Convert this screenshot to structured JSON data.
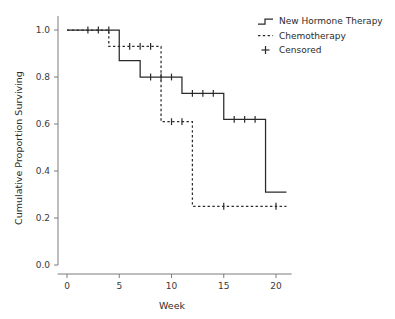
{
  "chart_data": {
    "type": "line",
    "title": "",
    "xlabel": "Week",
    "ylabel": "Cumulative Proportion Surviving",
    "xlim": [
      -0.9,
      21.5
    ],
    "ylim": [
      0.0,
      1.06
    ],
    "xticks": [
      0,
      5,
      10,
      15,
      20
    ],
    "xtick_labels": [
      "0",
      "5",
      "10",
      "15",
      "20"
    ],
    "yticks": [
      0.0,
      0.2,
      0.4,
      0.6,
      0.8,
      1.0
    ],
    "ytick_labels": [
      "0.0",
      "0.2",
      "0.4",
      "0.6",
      "0.8",
      "1.0"
    ],
    "grid": false,
    "legend_position": "top-right",
    "series": [
      {
        "name": "New Hormone Therapy",
        "style": "solid",
        "color": "#2a2a2a",
        "step_points": [
          [
            0,
            1.0
          ],
          [
            5,
            1.0
          ],
          [
            5,
            0.87
          ],
          [
            7,
            0.87
          ],
          [
            7,
            0.8
          ],
          [
            11,
            0.8
          ],
          [
            11,
            0.73
          ],
          [
            15,
            0.73
          ],
          [
            15,
            0.62
          ],
          [
            19,
            0.62
          ],
          [
            19,
            0.31
          ],
          [
            21,
            0.31
          ]
        ],
        "censored_weeks": [
          2,
          3,
          4,
          8,
          9,
          10,
          12,
          13,
          14,
          16,
          17,
          18
        ],
        "censored_values": [
          1.0,
          1.0,
          1.0,
          0.8,
          0.8,
          0.8,
          0.73,
          0.73,
          0.73,
          0.62,
          0.62,
          0.62
        ]
      },
      {
        "name": "Chemotherapy",
        "style": "dashed",
        "color": "#2a2a2a",
        "step_points": [
          [
            0,
            1.0
          ],
          [
            4,
            1.0
          ],
          [
            4,
            0.93
          ],
          [
            9,
            0.93
          ],
          [
            9,
            0.61
          ],
          [
            12,
            0.61
          ],
          [
            12,
            0.25
          ],
          [
            21,
            0.25
          ]
        ],
        "censored_weeks": [
          6,
          7,
          8,
          10,
          11,
          15,
          20
        ],
        "censored_values": [
          0.93,
          0.93,
          0.93,
          0.61,
          0.61,
          0.25,
          0.25
        ]
      }
    ]
  },
  "legend": {
    "entries": [
      {
        "label": "New Hormone Therapy",
        "marker": "solid-step-line"
      },
      {
        "label": "Chemotherapy",
        "marker": "dashed-line"
      },
      {
        "label": "Censored",
        "marker": "plus-marker"
      }
    ]
  }
}
